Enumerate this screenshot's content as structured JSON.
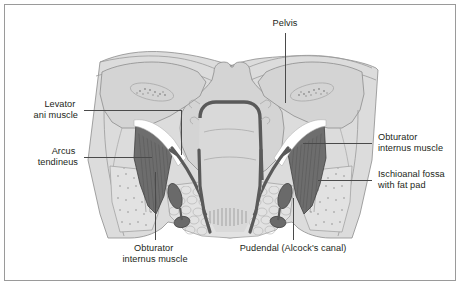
{
  "figure": {
    "kind": "anatomical-illustration",
    "view": "coronal-section-of-pelvis",
    "background_color": "#ffffff",
    "border_color": "#9a9a9a",
    "text_color": "#231f20",
    "leader_color": "#4a4a4a",
    "muscle_color": "#6e6e6e",
    "bone_color": "#dcdcdc",
    "fat_color": "#e2e2e2"
  },
  "labels": {
    "pelvis": {
      "line1": "Pelvis",
      "line2": ""
    },
    "levator_ani": {
      "line1": "Levator",
      "line2": "ani muscle"
    },
    "arcus_tendineus": {
      "line1": "Arcus",
      "line2": "tendineus"
    },
    "obturator_internus_right": {
      "line1": "Obturator",
      "line2": "internus muscle"
    },
    "ischioanal_fossa": {
      "line1": "Ischioanal fossa",
      "line2": "with fat pad"
    },
    "obturator_internus_bottom": {
      "line1": "Obturator",
      "line2": "internus muscle"
    },
    "pudendal_canal": {
      "line1": "Pudendal (Alcock's canal)",
      "line2": ""
    }
  }
}
